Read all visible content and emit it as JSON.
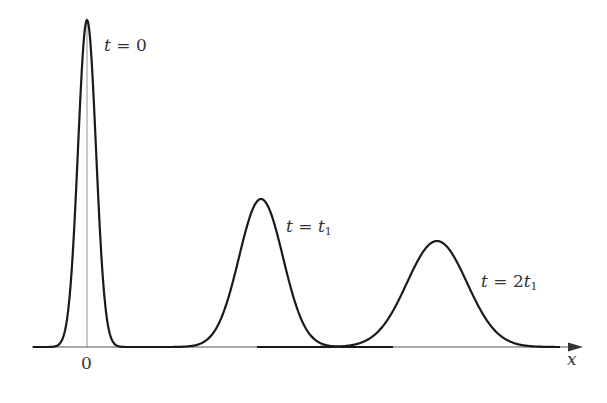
{
  "figure": {
    "axis": {
      "x_label": "x",
      "origin_label": "0"
    },
    "curves": [
      {
        "label_var": "t",
        "label_eq": " = ",
        "label_val": "0",
        "label_sub": "",
        "center_px": 87,
        "peak_px": 20,
        "sigma_px": 9
      },
      {
        "label_var": "t",
        "label_eq": " = ",
        "label_val": "t",
        "label_sub": "1",
        "center_px": 261,
        "peak_px": 199,
        "sigma_px": 22
      },
      {
        "label_var": "t",
        "label_eq": " = 2",
        "label_val": "t",
        "label_sub": "1",
        "center_px": 437,
        "peak_px": 241,
        "sigma_px": 30
      }
    ],
    "colors": {
      "curve": "#1a1a1a",
      "axis": "#555555",
      "text": "#333333"
    }
  }
}
